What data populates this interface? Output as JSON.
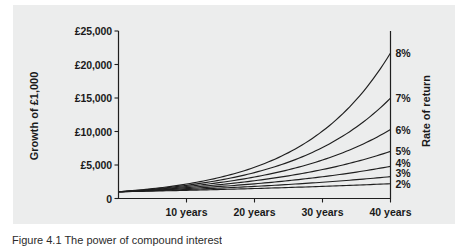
{
  "figure": {
    "caption": "Figure 4.1 The power of compound interest",
    "panel_color": "#eceded",
    "line_color": "#1f1f1f"
  },
  "chart_data": {
    "type": "line",
    "title": "",
    "subtitle": "",
    "xlabel": "",
    "ylabel": "Growth of £1,000",
    "right_axis_label": "Rate of return",
    "xlim": [
      0,
      40
    ],
    "ylim": [
      0,
      25000
    ],
    "grid": false,
    "legend_position": "right-axis-end-labels",
    "x": [
      0,
      5,
      10,
      15,
      20,
      25,
      30,
      35,
      40
    ],
    "x_tick_values": [
      10,
      20,
      30,
      40
    ],
    "x_tick_labels": [
      "10 years",
      "20 years",
      "30 years",
      "40 years"
    ],
    "y_tick_values": [
      0,
      5000,
      10000,
      15000,
      20000,
      25000
    ],
    "y_tick_labels": [
      "0",
      "£5,000",
      "£10,000",
      "£15,000",
      "£20,000",
      "£25,000"
    ],
    "series": [
      {
        "name": "2%",
        "rate_percent": 2,
        "end_label": "2%",
        "values": [
          1000,
          1104,
          1219,
          1346,
          1486,
          1641,
          1811,
          2000,
          2208
        ]
      },
      {
        "name": "3%",
        "rate_percent": 3,
        "end_label": "3%",
        "values": [
          1000,
          1159,
          1344,
          1558,
          1806,
          2094,
          2427,
          2814,
          3262
        ]
      },
      {
        "name": "4%",
        "rate_percent": 4,
        "end_label": "4%",
        "values": [
          1000,
          1217,
          1480,
          1801,
          2191,
          2666,
          3243,
          3946,
          4801
        ]
      },
      {
        "name": "5%",
        "rate_percent": 5,
        "end_label": "5%",
        "values": [
          1000,
          1276,
          1629,
          2079,
          2653,
          3386,
          4322,
          5516,
          7040
        ]
      },
      {
        "name": "6%",
        "rate_percent": 6,
        "end_label": "6%",
        "values": [
          1000,
          1338,
          1791,
          2397,
          3207,
          4292,
          5743,
          7686,
          10286
        ]
      },
      {
        "name": "7%",
        "rate_percent": 7,
        "end_label": "7%",
        "values": [
          1000,
          1403,
          1967,
          2759,
          3870,
          5427,
          7612,
          10677,
          14974
        ]
      },
      {
        "name": "8%",
        "rate_percent": 8,
        "end_label": "8%",
        "values": [
          1000,
          1469,
          2159,
          3172,
          4661,
          6848,
          10063,
          14785,
          21725
        ]
      }
    ]
  }
}
